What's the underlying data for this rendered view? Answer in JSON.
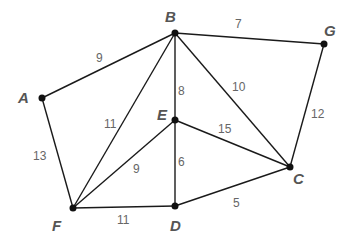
{
  "graph": {
    "nodes": [
      {
        "id": "A",
        "label": "A",
        "x": 42,
        "y": 98,
        "lx": 18,
        "ly": 103
      },
      {
        "id": "B",
        "label": "B",
        "x": 175,
        "y": 33,
        "lx": 165,
        "ly": 22
      },
      {
        "id": "G",
        "label": "G",
        "x": 324,
        "y": 44,
        "lx": 324,
        "ly": 36
      },
      {
        "id": "E",
        "label": "E",
        "x": 175,
        "y": 120,
        "lx": 157,
        "ly": 120
      },
      {
        "id": "C",
        "label": "C",
        "x": 290,
        "y": 167,
        "lx": 293,
        "ly": 184
      },
      {
        "id": "F",
        "label": "F",
        "x": 73,
        "y": 208,
        "lx": 52,
        "ly": 231
      },
      {
        "id": "D",
        "label": "D",
        "x": 175,
        "y": 206,
        "lx": 170,
        "ly": 231
      }
    ],
    "edges": [
      {
        "from": "A",
        "to": "B",
        "weight": "9",
        "lx": 96,
        "ly": 62
      },
      {
        "from": "B",
        "to": "G",
        "weight": "7",
        "lx": 235,
        "ly": 28
      },
      {
        "from": "B",
        "to": "E",
        "weight": "8",
        "lx": 178,
        "ly": 95
      },
      {
        "from": "B",
        "to": "C",
        "weight": "10",
        "lx": 232,
        "ly": 91
      },
      {
        "from": "G",
        "to": "C",
        "weight": "12",
        "lx": 311,
        "ly": 118
      },
      {
        "from": "B",
        "to": "F",
        "weight": "11",
        "lx": 104,
        "ly": 128
      },
      {
        "from": "A",
        "to": "F",
        "weight": "13",
        "lx": 33,
        "ly": 160
      },
      {
        "from": "E",
        "to": "C",
        "weight": "15",
        "lx": 218,
        "ly": 133
      },
      {
        "from": "E",
        "to": "F",
        "weight": "9",
        "lx": 133,
        "ly": 173
      },
      {
        "from": "E",
        "to": "D",
        "weight": "6",
        "lx": 178,
        "ly": 166
      },
      {
        "from": "F",
        "to": "D",
        "weight": "11",
        "lx": 117,
        "ly": 224
      },
      {
        "from": "D",
        "to": "C",
        "weight": "5",
        "lx": 233,
        "ly": 207
      }
    ]
  }
}
